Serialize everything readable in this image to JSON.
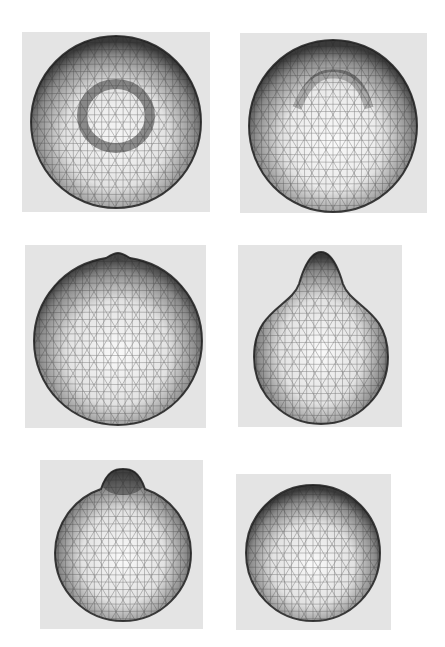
{
  "figure": {
    "background_color": "#ffffff",
    "panel_background_color": "#e4e4e4",
    "mesh_line_color": "#2a2a2a",
    "panels": [
      {
        "id": 1,
        "label": "sphere-with-circular-dimple",
        "shape": "sphere with a ring-shaped depression near the center",
        "box": {
          "x": 22,
          "y": 32,
          "w": 188,
          "h": 180
        },
        "center": [
          116,
          122
        ],
        "rx": 85,
        "ry": 86
      },
      {
        "id": 2,
        "label": "sphere-with-upward-ridge",
        "shape": "sphere with a crescent-shaped ridge forming near the top",
        "box": {
          "x": 240,
          "y": 33,
          "w": 187,
          "h": 180
        },
        "center": [
          333,
          126
        ],
        "rx": 84,
        "ry": 86
      },
      {
        "id": 3,
        "label": "sphere-with-small-apex",
        "shape": "sphere with a narrow pointed bulge at the top",
        "box": {
          "x": 25,
          "y": 245,
          "w": 181,
          "h": 183
        },
        "center": [
          118,
          341
        ],
        "rx": 84,
        "ry": 84
      },
      {
        "id": 4,
        "label": "pear-shaped-droplet",
        "shape": "pear-shaped body with a prominent neck on top",
        "box": {
          "x": 238,
          "y": 245,
          "w": 164,
          "h": 182
        },
        "center": [
          321,
          357
        ],
        "rx": 67,
        "ry": 67
      },
      {
        "id": 5,
        "label": "sphere-with-small-bud",
        "shape": "sphere with a small bud protruding at the top",
        "box": {
          "x": 40,
          "y": 460,
          "w": 163,
          "h": 169
        },
        "center": [
          123,
          553
        ],
        "rx": 68,
        "ry": 68
      },
      {
        "id": 6,
        "label": "relaxed-sphere",
        "shape": "nearly perfect sphere",
        "box": {
          "x": 236,
          "y": 474,
          "w": 155,
          "h": 156
        },
        "center": [
          313,
          553
        ],
        "rx": 67,
        "ry": 68
      }
    ]
  }
}
